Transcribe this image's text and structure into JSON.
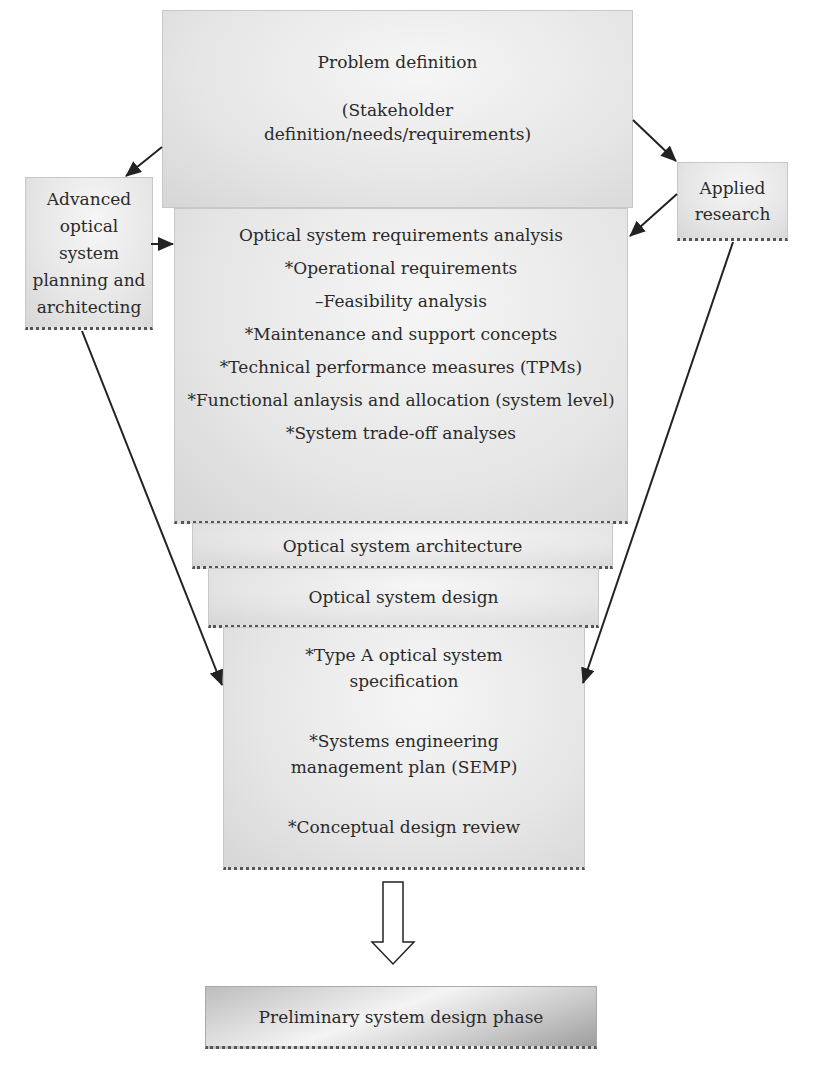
{
  "diagram": {
    "title_box": {
      "title": "Problem definition",
      "subtitle_line1": "(Stakeholder",
      "subtitle_line2": "definition/needs/requirements)"
    },
    "left_box": {
      "lines": [
        "Advanced",
        "optical",
        "system",
        "planning and",
        "architecting"
      ]
    },
    "right_box": {
      "lines": [
        "Applied",
        "research"
      ]
    },
    "requirements_box": {
      "title": "Optical system requirements analysis",
      "items": [
        "*Operational requirements",
        "–Feasibility analysis",
        "*Maintenance and support concepts",
        "*Technical performance measures (TPMs)",
        "*Functional anlaysis and allocation (system level)",
        "*System trade-off analyses"
      ]
    },
    "architecture_box": {
      "label": "Optical system architecture"
    },
    "design_box": {
      "label": "Optical system design"
    },
    "outputs_box": {
      "items": [
        [
          "*Type A optical system",
          "specification"
        ],
        [
          "*Systems engineering",
          "management plan (SEMP)"
        ],
        [
          "*Conceptual design review"
        ]
      ]
    },
    "next_phase_box": {
      "label": "Preliminary system design phase"
    },
    "connectors": [
      {
        "from": "problem-definition",
        "to": "advanced-planning"
      },
      {
        "from": "problem-definition",
        "to": "applied-research"
      },
      {
        "from": "advanced-planning",
        "to": "requirements-analysis"
      },
      {
        "from": "applied-research",
        "to": "requirements-analysis"
      },
      {
        "from": "advanced-planning",
        "to": "outputs"
      },
      {
        "from": "applied-research",
        "to": "outputs"
      },
      {
        "from": "outputs",
        "to": "preliminary-design-phase",
        "style": "hollow-block-arrow"
      }
    ]
  }
}
